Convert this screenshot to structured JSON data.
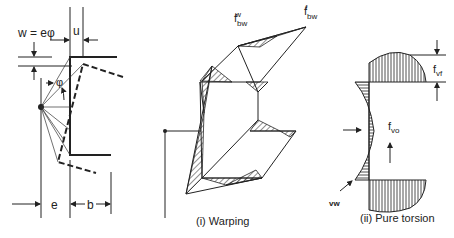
{
  "left_diagram": {
    "formula_label": "w = eφ",
    "u_label": "u",
    "phi_label": "φ",
    "e_label": "e",
    "b_label": "b"
  },
  "warping_diagram": {
    "fbw_w_label": "f",
    "fbw_w_sub": "bw",
    "fbw_w_sup": "w",
    "fbw_f_label": "f",
    "fbw_f_sub": "bw",
    "fbw_f_sup": "f",
    "caption": "(i)  Warping"
  },
  "torsion_diagram": {
    "fvf_label": "f",
    "fvf_sub": "vf",
    "fvo_label": "f",
    "fvo_sub": "vo",
    "vw_label": "vw",
    "caption": "(ii) Pure torsion"
  }
}
